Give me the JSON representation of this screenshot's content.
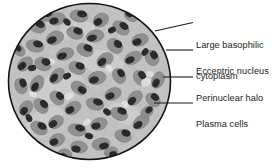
{
  "figure": {
    "kind": "histology-micrograph-diagram",
    "subject": "Plasma cells",
    "field_shape": "circle"
  },
  "labels": [
    {
      "id": "large-basophilic-cytoplasm",
      "lines": [
        "Large basophilic",
        "cytoplasm"
      ],
      "text": "Large basophilic cytoplasm"
    },
    {
      "id": "eccentric-nucleus",
      "lines": [
        "Eccentric nucleus"
      ],
      "text": "Eccentric nucleus"
    },
    {
      "id": "perinuclear-halo",
      "lines": [
        "Perinuclear halo"
      ],
      "text": "Perinuclear halo"
    },
    {
      "id": "plasma-cells",
      "lines": [
        "Plasma cells"
      ],
      "text": "Plasma cells"
    }
  ],
  "colors": {
    "background": "#ffffff",
    "outline": "#121212",
    "leader_line": "#1b1b1b",
    "text": "#1b1b1b",
    "field_light": "#c9c9c9",
    "field_mid": "#8d8d8d",
    "nucleus_dark": "#131313",
    "halo_white": "#f2f2f2"
  }
}
